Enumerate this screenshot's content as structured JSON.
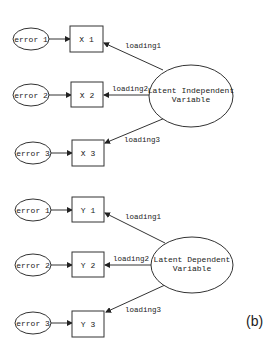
{
  "figure_label": "(b)",
  "colors": {
    "stroke": "#333333",
    "text": "#222222",
    "background": "#ffffff"
  },
  "panels": [
    {
      "latent": {
        "line1": "Latent Independent",
        "line2": "Variable"
      },
      "indicators": [
        "X 1",
        "X 2",
        "X 3"
      ],
      "errors": [
        "error 1",
        "error 2",
        "error 3"
      ],
      "loadings": [
        "loading1",
        "loading2",
        "loading3"
      ]
    },
    {
      "latent": {
        "line1": "Latent Dependent",
        "line2": "Variable"
      },
      "indicators": [
        "Y 1",
        "Y 2",
        "Y 3"
      ],
      "errors": [
        "error 1",
        "error 2",
        "error 3"
      ],
      "loadings": [
        "loading1",
        "loading2",
        "loading3"
      ]
    }
  ]
}
